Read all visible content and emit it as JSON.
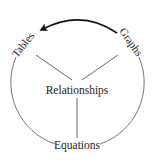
{
  "diagram": {
    "type": "cycle-with-hub",
    "center_label": "Relationships",
    "nodes": [
      {
        "id": "tables",
        "label": "Tables",
        "position": "upper-left"
      },
      {
        "id": "graphs",
        "label": "Graphs",
        "position": "upper-right"
      },
      {
        "id": "equations",
        "label": "Equations",
        "position": "bottom"
      }
    ],
    "connections": [
      {
        "from": "relationships",
        "to": "tables",
        "style": "line"
      },
      {
        "from": "relationships",
        "to": "graphs",
        "style": "line"
      },
      {
        "from": "relationships",
        "to": "equations",
        "style": "line"
      }
    ],
    "arrow": {
      "from": "graphs",
      "to": "tables",
      "style": "bold-curved-arrow"
    },
    "colors": {
      "stroke": "#555555",
      "arrow": "#111111",
      "text": "#222222",
      "background": "#ffffff"
    }
  }
}
